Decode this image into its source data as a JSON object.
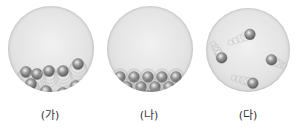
{
  "panels": [
    {
      "label": "(가)",
      "state": "liquid",
      "particles": [
        {
          "x": 18,
          "y": 66
        },
        {
          "x": 29,
          "y": 68
        },
        {
          "x": 41,
          "y": 65
        },
        {
          "x": 55,
          "y": 65
        },
        {
          "x": 70,
          "y": 58
        },
        {
          "x": 23,
          "y": 78
        },
        {
          "x": 38,
          "y": 85
        },
        {
          "x": 55,
          "y": 87
        },
        {
          "x": 68,
          "y": 80
        }
      ]
    },
    {
      "label": "(나)",
      "state": "solid",
      "particles": [
        {
          "x": 13,
          "y": 71
        },
        {
          "x": 27,
          "y": 71
        },
        {
          "x": 41,
          "y": 71
        },
        {
          "x": 55,
          "y": 71
        },
        {
          "x": 69,
          "y": 71
        },
        {
          "x": 20,
          "y": 81
        },
        {
          "x": 34,
          "y": 81
        },
        {
          "x": 48,
          "y": 81
        },
        {
          "x": 62,
          "y": 81
        },
        {
          "x": 76,
          "y": 81
        },
        {
          "x": 27,
          "y": 90
        },
        {
          "x": 41,
          "y": 90
        },
        {
          "x": 55,
          "y": 90
        }
      ]
    },
    {
      "label": "(다)",
      "state": "gas",
      "particles": [
        {
          "x": 45,
          "y": 27
        },
        {
          "x": 16,
          "y": 51
        },
        {
          "x": 67,
          "y": 53
        },
        {
          "x": 48,
          "y": 77
        }
      ]
    }
  ],
  "colors": {
    "flask": "#e4e4e4",
    "particle_dark": "#6e6e6e",
    "particle_light": "#d8d8d8"
  }
}
